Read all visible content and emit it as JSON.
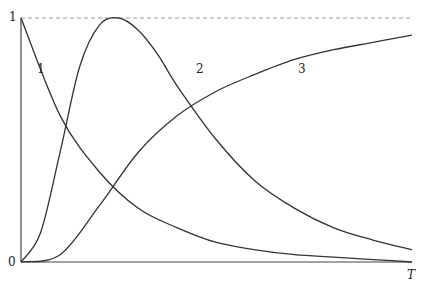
{
  "chart_data": {
    "type": "line",
    "title": "",
    "xlabel": "T",
    "ylabel": "",
    "ylim": [
      0,
      1
    ],
    "xlim": [
      0,
      1
    ],
    "yticks": [
      "0",
      "1"
    ],
    "reference_line": {
      "y": 1,
      "style": "dashed"
    },
    "grid": false,
    "series": [
      {
        "name": "1",
        "description": "monotonically decaying from 1 toward 0",
        "x": [
          0,
          0.1,
          0.2,
          0.3,
          0.4,
          0.5,
          0.6,
          0.7,
          0.8,
          0.9,
          1.0
        ],
        "values": [
          1.0,
          0.6,
          0.37,
          0.22,
          0.14,
          0.08,
          0.05,
          0.03,
          0.02,
          0.01,
          0.0
        ]
      },
      {
        "name": "2",
        "description": "rises from 0, peaks at 1, decays",
        "x": [
          0,
          0.05,
          0.1,
          0.15,
          0.2,
          0.25,
          0.3,
          0.35,
          0.4,
          0.5,
          0.6,
          0.7,
          0.8,
          0.9,
          1.0
        ],
        "values": [
          0.0,
          0.12,
          0.45,
          0.8,
          0.97,
          1.0,
          0.95,
          0.85,
          0.72,
          0.5,
          0.33,
          0.22,
          0.14,
          0.09,
          0.05
        ]
      },
      {
        "name": "3",
        "description": "S-shaped rise from 0 toward ~0.93",
        "x": [
          0,
          0.1,
          0.2,
          0.3,
          0.4,
          0.5,
          0.6,
          0.7,
          0.8,
          0.9,
          1.0
        ],
        "values": [
          0.0,
          0.03,
          0.23,
          0.45,
          0.6,
          0.7,
          0.77,
          0.83,
          0.87,
          0.9,
          0.93
        ]
      }
    ]
  },
  "labels": {
    "x_axis": "T",
    "y_zero": "0",
    "y_one": "1",
    "curve1": "1",
    "curve2": "2",
    "curve3": "3"
  }
}
